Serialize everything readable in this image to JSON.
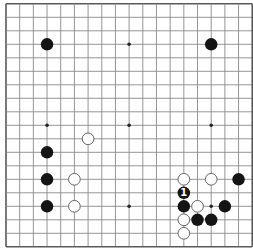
{
  "board": {
    "size": 19,
    "origin_x": 6,
    "origin_y": 3.8,
    "spacing_x": 13.68,
    "spacing_y": 13.5,
    "colors": {
      "background": "#ffffff",
      "grid_line": "#8a8a8a",
      "border_line": "#5a5a5a",
      "black_stone": "#141414",
      "white_stone_fill": "#ffffff",
      "white_stone_stroke": "#555555",
      "hoshi": "#222222",
      "label_on_black": "#ffffff"
    },
    "hoshi": [
      [
        3,
        3
      ],
      [
        9,
        3
      ],
      [
        15,
        3
      ],
      [
        3,
        9
      ],
      [
        9,
        9
      ],
      [
        15,
        9
      ],
      [
        3,
        15
      ],
      [
        9,
        15
      ],
      [
        15,
        15
      ]
    ],
    "stones": [
      {
        "color": "black",
        "col": 3,
        "row": 3
      },
      {
        "color": "black",
        "col": 15,
        "row": 3
      },
      {
        "color": "white",
        "col": 6,
        "row": 10
      },
      {
        "color": "black",
        "col": 3,
        "row": 11
      },
      {
        "color": "black",
        "col": 3,
        "row": 13
      },
      {
        "color": "white",
        "col": 5,
        "row": 13
      },
      {
        "color": "black",
        "col": 3,
        "row": 15
      },
      {
        "color": "white",
        "col": 5,
        "row": 15
      },
      {
        "color": "white",
        "col": 13,
        "row": 13
      },
      {
        "color": "white",
        "col": 15,
        "row": 13
      },
      {
        "color": "black",
        "col": 17,
        "row": 13
      },
      {
        "color": "black",
        "col": 13,
        "row": 14,
        "label": "1"
      },
      {
        "color": "black",
        "col": 13,
        "row": 15
      },
      {
        "color": "white",
        "col": 14,
        "row": 15
      },
      {
        "color": "black",
        "col": 16,
        "row": 15
      },
      {
        "color": "white",
        "col": 13,
        "row": 16
      },
      {
        "color": "black",
        "col": 14,
        "row": 16
      },
      {
        "color": "black",
        "col": 15,
        "row": 16
      },
      {
        "color": "white",
        "col": 13,
        "row": 17
      }
    ]
  }
}
